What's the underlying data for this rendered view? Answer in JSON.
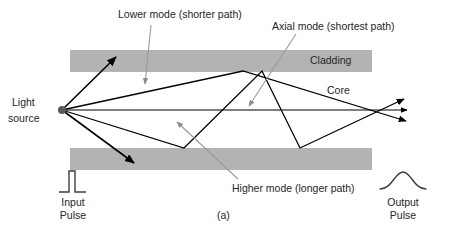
{
  "figure": {
    "caption": "(a)",
    "labels": {
      "lower_mode": "Lower mode (shorter path)",
      "axial_mode": "Axial mode (shortest path)",
      "higher_mode": "Higher mode (longer path)",
      "light_source_line1": "Light",
      "light_source_line2": "source",
      "cladding": "Cladding",
      "core": "Core",
      "input_pulse_line1": "Input",
      "input_pulse_line2": "Pulse",
      "output_pulse_line1": "Output",
      "output_pulse_line2": "Pulse"
    },
    "colors": {
      "cladding_fill": "#b3b3b3",
      "ray_stroke": "#000000",
      "callout_stroke": "#808080",
      "text": "#262626",
      "background": "#ffffff"
    }
  }
}
